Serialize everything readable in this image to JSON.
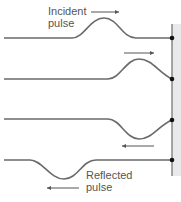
{
  "diagram": {
    "labels": {
      "incident_line1": "Incident",
      "incident_line2": "pulse",
      "reflected_line1": "Reflected",
      "reflected_line2": "pulse"
    },
    "frames": [
      {
        "name": "frame-1",
        "pulse": "upright",
        "direction": "right"
      },
      {
        "name": "frame-2",
        "pulse": "upright-at-wall",
        "direction": "right"
      },
      {
        "name": "frame-3",
        "pulse": "inverted-at-wall",
        "direction": "left"
      },
      {
        "name": "frame-4",
        "pulse": "inverted",
        "direction": "left"
      }
    ],
    "colors": {
      "string": "#6a6a6a",
      "wall": "#777777",
      "wall_shade": "#e6e6e6",
      "dot": "#111111",
      "arrow": "#555555",
      "text": "#555555"
    }
  }
}
